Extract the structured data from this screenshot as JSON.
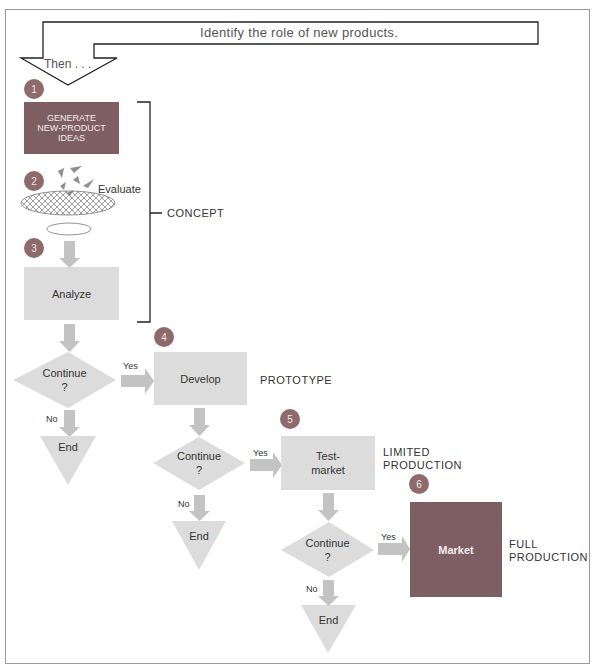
{
  "header": {
    "banner_text": "Identify the role of new products.",
    "then_text": "Then . . ."
  },
  "steps": [
    {
      "number": "1",
      "label_lines": [
        "GENERATE",
        "NEW-PRODUCT",
        "IDEAS"
      ]
    },
    {
      "number": "2",
      "label": "Evaluate"
    },
    {
      "number": "3",
      "label": "Analyze"
    },
    {
      "number": "4",
      "label": "Develop"
    },
    {
      "number": "5",
      "label_lines": [
        "Test-",
        "market"
      ]
    },
    {
      "number": "6",
      "label": "Market"
    }
  ],
  "decisions": [
    {
      "label": "Continue",
      "q": "?",
      "yes": "Yes",
      "no": "No",
      "end": "End"
    },
    {
      "label": "Continue",
      "q": "?",
      "yes": "Yes",
      "no": "No",
      "end": "End"
    },
    {
      "label": "Continue",
      "q": "?",
      "yes": "Yes",
      "no": "No",
      "end": "End"
    }
  ],
  "stages": {
    "concept": "CONCEPT",
    "prototype": "PROTOTYPE",
    "limited_lines": [
      "LIMITED",
      "PRODUCTION"
    ],
    "full_lines": [
      "FULL",
      "PRODUCTION"
    ]
  },
  "colors": {
    "dark_box": "#7d5e62",
    "light_box": "#dcdcdc",
    "arrow": "#c3c3c3",
    "badge": "#8e6a6d"
  }
}
